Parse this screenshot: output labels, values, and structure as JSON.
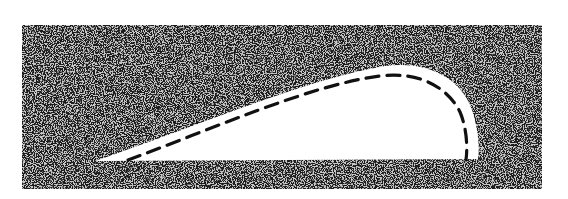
{
  "figure": {
    "kind": "airfoil-cross-section-diagram",
    "background": "#ffffff",
    "stipple": {
      "box": {
        "x": 22,
        "y": 25,
        "w": 520,
        "h": 164
      },
      "dark": "#2a2a2a",
      "light": "#bdbdbd"
    },
    "cutout": {
      "fill": "#ffffff",
      "path": "M 95 161 C 200 125, 310 78, 385 66 C 430 60, 462 80, 472 110 C 478 128, 480 148, 478 159 L 95 161 Z"
    },
    "dashed_curve": {
      "stroke": "#111111",
      "width": 3.2,
      "dash": "13 8",
      "path": "M 128 160 C 215 128, 310 85, 380 76 C 420 71, 448 88, 460 112 C 466 126, 468 145, 466 160"
    }
  }
}
